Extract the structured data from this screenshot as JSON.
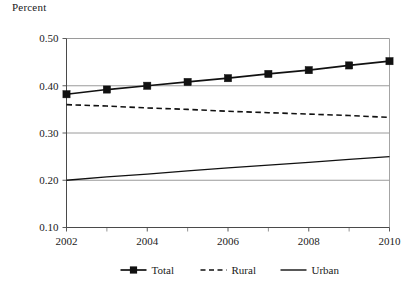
{
  "chart_data": {
    "type": "line",
    "title": "",
    "ylabel": "Percent",
    "xlabel": "",
    "ylim": [
      0.1,
      0.5
    ],
    "xlim": [
      2002,
      2010
    ],
    "grid": true,
    "grid_axis": "y",
    "legend_position": "bottom-center",
    "x": [
      2002,
      2003,
      2004,
      2005,
      2006,
      2007,
      2008,
      2009,
      2010
    ],
    "ytick_labels": [
      "0.50",
      "0.40",
      "0.30",
      "0.20",
      "0.10"
    ],
    "ytick_values": [
      0.5,
      0.4,
      0.3,
      0.2,
      0.1
    ],
    "xtick_labels": [
      "2002",
      "2004",
      "2006",
      "2008",
      "2010"
    ],
    "xtick_values": [
      2002,
      2004,
      2006,
      2008,
      2010
    ],
    "xminor_ticks": [
      2003,
      2005,
      2007,
      2009
    ],
    "series": [
      {
        "name": "Total",
        "style": "solid",
        "marker": "square",
        "color": "#111111",
        "values": [
          0.382,
          0.392,
          0.4,
          0.408,
          0.416,
          0.425,
          0.433,
          0.443,
          0.452
        ]
      },
      {
        "name": "Rural",
        "style": "dashed",
        "marker": "none",
        "color": "#111111",
        "values": [
          0.36,
          0.357,
          0.353,
          0.35,
          0.346,
          0.343,
          0.34,
          0.337,
          0.333
        ]
      },
      {
        "name": "Urban",
        "style": "solid",
        "marker": "none",
        "color": "#111111",
        "values": [
          0.2,
          0.207,
          0.213,
          0.22,
          0.226,
          0.232,
          0.238,
          0.244,
          0.25
        ]
      }
    ]
  },
  "legend": {
    "items": [
      {
        "label": "Total"
      },
      {
        "label": "Rural"
      },
      {
        "label": "Urban"
      }
    ]
  }
}
